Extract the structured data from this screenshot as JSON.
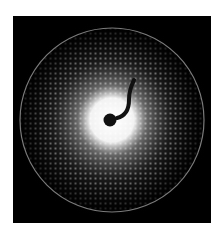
{
  "image": {
    "subject": "X-ray diffraction pattern",
    "background_color": "#000000",
    "ring_color": "#9a9a9a",
    "halo_color": "#ffffff",
    "spot_color": "#d8d8d8",
    "beamstop_color": "#111111"
  }
}
